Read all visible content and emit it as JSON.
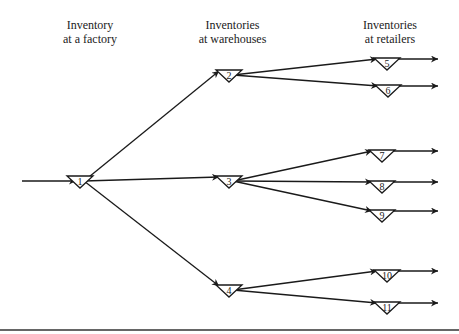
{
  "headers": {
    "factory": [
      "Inventory",
      "at a factory"
    ],
    "warehouses": [
      "Inventories",
      "at warehouses"
    ],
    "retailers": [
      "Inventories",
      "at retailers"
    ]
  },
  "nodes": [
    {
      "id": "1",
      "label": "1",
      "tier": "factory"
    },
    {
      "id": "2",
      "label": "2",
      "tier": "warehouse"
    },
    {
      "id": "3",
      "label": "3",
      "tier": "warehouse"
    },
    {
      "id": "4",
      "label": "4",
      "tier": "warehouse"
    },
    {
      "id": "5",
      "label": "5",
      "tier": "retailer"
    },
    {
      "id": "6",
      "label": "6",
      "tier": "retailer"
    },
    {
      "id": "7",
      "label": "7",
      "tier": "retailer"
    },
    {
      "id": "8",
      "label": "8",
      "tier": "retailer"
    },
    {
      "id": "9",
      "label": "9",
      "tier": "retailer"
    },
    {
      "id": "10",
      "label": "10",
      "tier": "retailer"
    },
    {
      "id": "11",
      "label": "11",
      "tier": "retailer"
    }
  ],
  "edges": [
    {
      "from": "source",
      "to": "1"
    },
    {
      "from": "1",
      "to": "2"
    },
    {
      "from": "1",
      "to": "3"
    },
    {
      "from": "1",
      "to": "4"
    },
    {
      "from": "2",
      "to": "5"
    },
    {
      "from": "2",
      "to": "6"
    },
    {
      "from": "3",
      "to": "7"
    },
    {
      "from": "3",
      "to": "8"
    },
    {
      "from": "3",
      "to": "9"
    },
    {
      "from": "4",
      "to": "10"
    },
    {
      "from": "4",
      "to": "11"
    },
    {
      "from": "5",
      "to": "out"
    },
    {
      "from": "6",
      "to": "out"
    },
    {
      "from": "7",
      "to": "out"
    },
    {
      "from": "8",
      "to": "out"
    },
    {
      "from": "9",
      "to": "out"
    },
    {
      "from": "10",
      "to": "out"
    },
    {
      "from": "11",
      "to": "out"
    }
  ],
  "colors": {
    "ink": "#1a1a1a"
  }
}
